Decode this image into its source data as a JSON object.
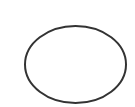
{
  "canvas": {
    "width": 135,
    "height": 107,
    "background": "#ffffff"
  },
  "shape": {
    "type": "ellipse",
    "cx": 75.5,
    "cy": 64.5,
    "rx": 50.5,
    "ry": 38.5,
    "stroke": "#333333",
    "stroke_width": 2,
    "fill": "none"
  }
}
